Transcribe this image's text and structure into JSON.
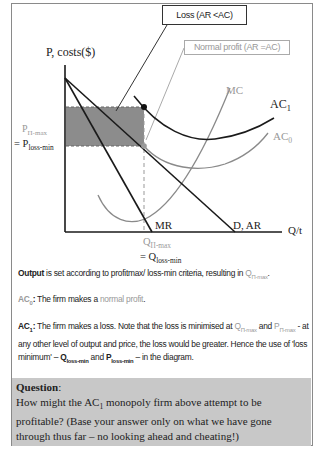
{
  "diagram": {
    "callouts": {
      "loss": "Loss (AR <AC)",
      "normal_profit": "Normal profit (AR =AC)"
    },
    "axes": {
      "y_label": "P, costs($)",
      "x_label": "Q/t"
    },
    "price_labels": {
      "p_max_main": "P",
      "p_max_sub": "Π-max",
      "p_loss_prefix": "= P",
      "p_loss_sub": "loss-min"
    },
    "quantity_labels": {
      "q_max_main": "Q",
      "q_max_sub": "Π-max",
      "q_loss_prefix": "= Q",
      "q_loss_sub": "loss-min"
    },
    "curves": {
      "mc": "MC",
      "ac1_main": "AC",
      "ac1_sub": "1",
      "ac0_main": "AC",
      "ac0_sub": "0",
      "mr": "MR",
      "demand": "D, AR"
    },
    "colors": {
      "shaded_loss": "#8c8c8c",
      "black_curve": "#1a1a1a",
      "gray_curve": "#8a8a8a",
      "normal_profit_text": "#999999",
      "question_bg": "#c8c8c8"
    }
  },
  "text": {
    "output_bold": "Output",
    "output_rest": " is set according to profitmax/ loss-min criteria, resulting in ",
    "output_q": "Q",
    "output_q_sub": "Π-max",
    "output_end": ".",
    "ac0_label": "AC",
    "ac0_sub": "0",
    "ac0_colon": ":",
    "ac0_text": " The firm makes a ",
    "ac0_normal": "normal profit",
    "ac0_end": ".",
    "ac1_label": "AC",
    "ac1_sub": "1",
    "ac1_colon": ":",
    "ac1_text1": " The firm makes a loss. Note that the loss is minimised at ",
    "ac1_q": "Q",
    "ac1_q_sub": "Π-max",
    "ac1_and": " and ",
    "ac1_p": "P",
    "ac1_p_sub": "Π-max",
    "ac1_text2": " - at any other level of output and price, the loss would be greater. Hence the use of 'loss minimum' – ",
    "ac1_qloss": "Q",
    "ac1_qloss_sub": "loss-min",
    "ac1_and2": " and ",
    "ac1_ploss": "P",
    "ac1_ploss_sub": "loss-min",
    "ac1_end": " – in the diagram."
  },
  "question": {
    "heading": "Question",
    "colon": ":",
    "body_1": "How might the AC",
    "body_sub": "1",
    "body_2": " monopoly firm above attempt to be profitable? (Base your answer only on what we have gone through thus far – no looking ahead and cheating!)"
  }
}
